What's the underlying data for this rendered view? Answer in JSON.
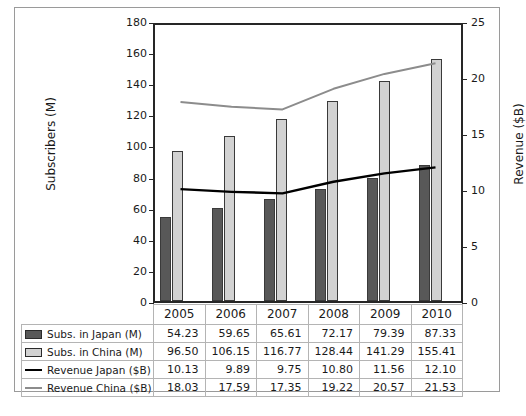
{
  "chart_data": {
    "type": "bar",
    "title": "",
    "xlabel": "",
    "ylabel": "Subscribers (M)",
    "ylabel_secondary": "Revenue ($B)",
    "categories": [
      "2005",
      "2006",
      "2007",
      "2008",
      "2009",
      "2010"
    ],
    "ylim": [
      0,
      180
    ],
    "ylim_secondary": [
      0,
      25
    ],
    "yticks": [
      0,
      20,
      40,
      60,
      80,
      100,
      120,
      140,
      160,
      180
    ],
    "yticks_secondary": [
      0,
      5,
      10,
      15,
      20,
      25
    ],
    "grid": false,
    "legend_position": "table-below",
    "series": [
      {
        "name": "Subs. in Japan (M)",
        "kind": "bar",
        "axis": "left",
        "color": "#585858",
        "values": [
          54.23,
          59.65,
          65.61,
          72.17,
          79.39,
          87.33
        ]
      },
      {
        "name": "Subs. in China (M)",
        "kind": "bar",
        "axis": "left",
        "color": "#d2d2d2",
        "values": [
          96.5,
          106.15,
          116.77,
          128.44,
          141.29,
          155.41
        ]
      },
      {
        "name": "Revenue Japan ($B)",
        "kind": "line",
        "axis": "right",
        "color": "#000000",
        "values": [
          10.13,
          9.89,
          9.75,
          10.8,
          11.56,
          12.1
        ]
      },
      {
        "name": "Revenue China ($B)",
        "kind": "line",
        "axis": "right",
        "color": "#8c8c8c",
        "values": [
          18.03,
          17.59,
          17.35,
          19.22,
          20.57,
          21.53
        ]
      }
    ]
  },
  "table": {
    "header": [
      "2005",
      "2006",
      "2007",
      "2008",
      "2009",
      "2010"
    ],
    "rows": [
      {
        "label": "Subs. in Japan (M)",
        "marker": "filled-dark-swatch",
        "values": [
          "54.23",
          "59.65",
          "65.61",
          "72.17",
          "79.39",
          "87.33"
        ]
      },
      {
        "label": "Subs. in China (M)",
        "marker": "filled-light-swatch",
        "values": [
          "96.50",
          "106.15",
          "116.77",
          "128.44",
          "141.29",
          "155.41"
        ]
      },
      {
        "label": "Revenue Japan ($B)",
        "marker": "black-line-swatch",
        "values": [
          "10.13",
          "9.89",
          "9.75",
          "10.80",
          "11.56",
          "12.10"
        ]
      },
      {
        "label": "Revenue China ($B)",
        "marker": "gray-line-swatch",
        "values": [
          "18.03",
          "17.59",
          "17.35",
          "19.22",
          "20.57",
          "21.53"
        ]
      }
    ]
  },
  "axis_labels": {
    "left_title": "Subscribers (M)",
    "right_title": "Revenue ($B)",
    "left_ticks": [
      "180",
      "160",
      "140",
      "120",
      "100",
      "80",
      "60",
      "40",
      "20",
      "0"
    ],
    "right_ticks": [
      "25",
      "20",
      "15",
      "10",
      "5",
      "0"
    ]
  },
  "colors": {
    "japan_bar": "#585858",
    "china_bar": "#d2d2d2",
    "japan_line": "#000000",
    "china_line": "#8c8c8c",
    "axis": "#262626",
    "frame": "#9a9a9a",
    "grid_line": "#b4b4b4"
  }
}
